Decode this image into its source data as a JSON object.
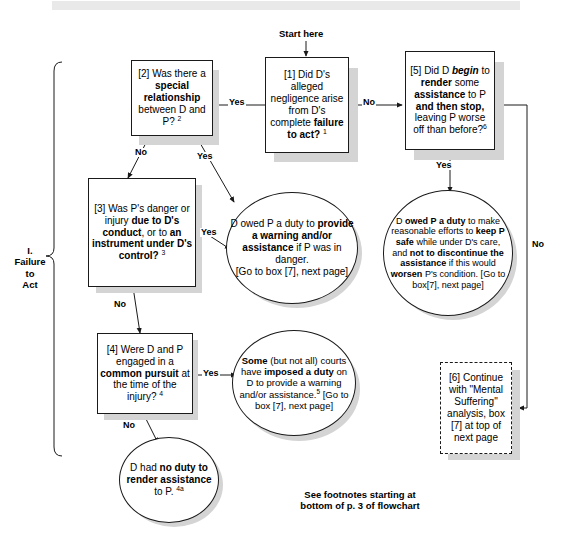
{
  "document": {
    "section_label": "I.\nFailure\nto\nAct",
    "start_label": "Start here",
    "footnote": "See footnotes starting at\nbottom of p. 3 of flowchart"
  },
  "nodes": {
    "box1": {
      "id": "[1]",
      "text_html": "[1] Did D's alleged negligence arise from D's complete <b>failure to act?</b> <sup>1</sup>",
      "shape": "rect"
    },
    "box2": {
      "id": "[2]",
      "text_html": "[2] Was there a <b>special relationship</b> between D and P? <sup>2</sup>",
      "shape": "rect"
    },
    "box3": {
      "id": "[3]",
      "text_html": "[3] Was P's danger or injury <b>due to D's conduct</b>, or to <b>an instrument under D's control?</b> <sup>3</sup>",
      "shape": "rect"
    },
    "box4": {
      "id": "[4]",
      "text_html": "[4] Were D and P engaged in a <b>common pursuit</b> at the time of the injury? <sup>4</sup>",
      "shape": "rect"
    },
    "box5": {
      "id": "[5]",
      "text_html": "[5] Did D <i>begin</i> to <b>render</b> some <b>assistance</b> to P <b>and then stop,</b> leaving P worse off than before?<sup>6</sup>",
      "shape": "rect"
    },
    "box6": {
      "id": "[6]",
      "text_html": "[6] Continue with \"Mental Suffering\" analysis, box [7] at top of next page",
      "shape": "rect-dashed"
    },
    "oval_warning": {
      "text_html": "D owed P a duty to <b>provide a warning and/or assistance</b> if P was in danger.<br><span class=\"small\">[Go to box [7], next page]</span>",
      "shape": "oval"
    },
    "oval_keepsafe": {
      "text_html": "D <b>owed P a duty</b> to make reasonable efforts to <b>keep P safe</b> while under D's care, and <b>not to discontinue the assistance</b> if this would <b>worsen</b> P's condition. [Go to box[7], next page]",
      "shape": "oval"
    },
    "oval_some_courts": {
      "text_html": "<b>Some</b> (but not all) courts have <b>imposed a duty</b> on D to provide a warning and/or assistance.<sup>5</sup> <span class=\"small\">[Go to box [7], next page]</span>",
      "shape": "oval"
    },
    "oval_no_duty": {
      "text_html": "D had <b>no duty to render assistance</b> to P. <sup>4a</sup>",
      "shape": "oval"
    }
  },
  "edges": [
    {
      "name": "start-to-box1",
      "label": ""
    },
    {
      "name": "box1-no-to-box5",
      "label": "No"
    },
    {
      "name": "box1-yes-to-box2",
      "label": "Yes"
    },
    {
      "name": "box2-no-to-box3",
      "label": "No"
    },
    {
      "name": "box2-yes-to-oval-warning",
      "label": "Yes"
    },
    {
      "name": "box3-yes-to-oval-warning",
      "label": "Yes"
    },
    {
      "name": "box3-no-to-box4",
      "label": "No"
    },
    {
      "name": "box4-yes-to-oval-some-courts",
      "label": "Yes"
    },
    {
      "name": "box4-no-to-oval-no-duty",
      "label": "No"
    },
    {
      "name": "box5-yes-to-oval-keepsafe",
      "label": "Yes"
    },
    {
      "name": "box5-no-to-box6",
      "label": "No"
    }
  ],
  "colors": {
    "stroke": "#1a1a1a",
    "shadow": "#d4d4d4",
    "background": "#ffffff",
    "topbar": "#e9e9e9"
  }
}
